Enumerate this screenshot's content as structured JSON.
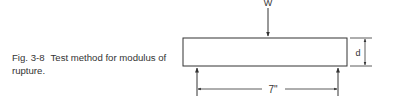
{
  "figure": {
    "number": "Fig. 3-8",
    "caption": "Test method for modulus of rupture."
  },
  "diagram": {
    "load_label": "W",
    "depth_label": "d",
    "span_label": "7\"",
    "stroke_color": "#333333"
  }
}
